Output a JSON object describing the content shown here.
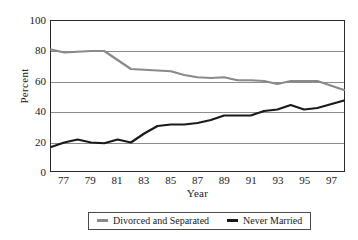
{
  "chart_data": {
    "type": "line",
    "title": "",
    "xlabel": "Year",
    "ylabel": "Percent",
    "xlim": [
      1976,
      1998
    ],
    "ylim": [
      0,
      100
    ],
    "grid": true,
    "legend_position": "bottom",
    "yticks": [
      100,
      80,
      60,
      40,
      20,
      0
    ],
    "xticks": [
      77,
      79,
      81,
      83,
      85,
      87,
      89,
      91,
      93,
      95,
      97
    ],
    "x": [
      1976,
      1977,
      1978,
      1979,
      1980,
      1981,
      1982,
      1983,
      1984,
      1985,
      1986,
      1987,
      1988,
      1989,
      1990,
      1991,
      1992,
      1993,
      1994,
      1995,
      1996,
      1997,
      1998
    ],
    "series": [
      {
        "name": "Divorced and Separated",
        "color": "#8a8a8a",
        "values": [
          81,
          79,
          79.5,
          80,
          80,
          74,
          68,
          67.5,
          67,
          66.5,
          64,
          62.5,
          62,
          62.5,
          60.5,
          60.5,
          60,
          58,
          60,
          60,
          60,
          57,
          54
        ]
      },
      {
        "name": "Never Married",
        "color": "#1a1a1a",
        "values": [
          16,
          19,
          21,
          19,
          18.5,
          21,
          19,
          25,
          30,
          31,
          31,
          32,
          34,
          37,
          37,
          37,
          40,
          41,
          44,
          41,
          42,
          44.5,
          47
        ]
      }
    ]
  },
  "legend": {
    "items": [
      {
        "label": "Divorced and Separated",
        "color": "#8a8a8a"
      },
      {
        "label": "Never Married",
        "color": "#1a1a1a"
      }
    ]
  },
  "axes": {
    "y_title": "Percent",
    "x_title": "Year"
  }
}
